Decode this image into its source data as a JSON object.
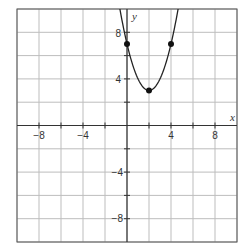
{
  "chart_data": {
    "type": "line",
    "title": "",
    "xlabel": "x",
    "ylabel": "y",
    "xlim": [
      -10,
      10
    ],
    "ylim": [
      -10,
      10
    ],
    "grid": true,
    "grid_step": 2,
    "x_tick_labels": [
      "−8",
      "−4",
      "4",
      "8"
    ],
    "x_ticks": [
      -8,
      -4,
      4,
      8
    ],
    "y_tick_labels": [
      "8",
      "4",
      "−4",
      "−8"
    ],
    "y_ticks": [
      8,
      4,
      -4,
      -8
    ],
    "series": [
      {
        "name": "parabola",
        "equation": "y = (x - 2)^2 + 3",
        "vertex": [
          2,
          3
        ],
        "points": [
          [
            0,
            7
          ],
          [
            2,
            3
          ],
          [
            4,
            7
          ]
        ]
      }
    ]
  },
  "labels": {
    "x_axis": "x",
    "y_axis": "y",
    "xt": [
      "−8",
      "−4",
      "4",
      "8"
    ],
    "yt": [
      "8",
      "4",
      "−4",
      "−8"
    ]
  }
}
